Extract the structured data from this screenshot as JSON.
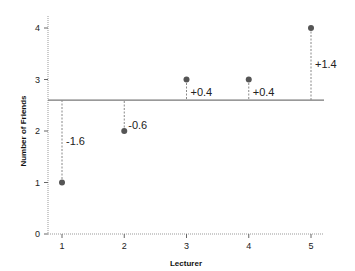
{
  "chart_data": {
    "type": "scatter",
    "title": "",
    "xlabel": "Lecturer",
    "ylabel": "Number of Friends",
    "x": [
      1,
      2,
      3,
      4,
      5
    ],
    "values": [
      1,
      2,
      3,
      3,
      4
    ],
    "categories": [
      "1",
      "2",
      "3",
      "4",
      "5"
    ],
    "xlim": [
      0.78,
      5.21
    ],
    "ylim": [
      0,
      4.25
    ],
    "xticks": [
      1,
      2,
      3,
      4,
      5
    ],
    "yticks": [
      0,
      1,
      2,
      3,
      4
    ],
    "mean_line": 2.6,
    "deviations": [
      -1.6,
      -0.6,
      0.4,
      0.4,
      1.4
    ],
    "annotations": [
      "-1.6",
      "-0.6",
      "+0.4",
      "+0.4",
      "+1.4"
    ],
    "grid": false,
    "legend": null,
    "colors": {
      "point": "#555555",
      "mean_line": "#777777",
      "deviation_line": "#888888",
      "axis": "#999999"
    }
  }
}
